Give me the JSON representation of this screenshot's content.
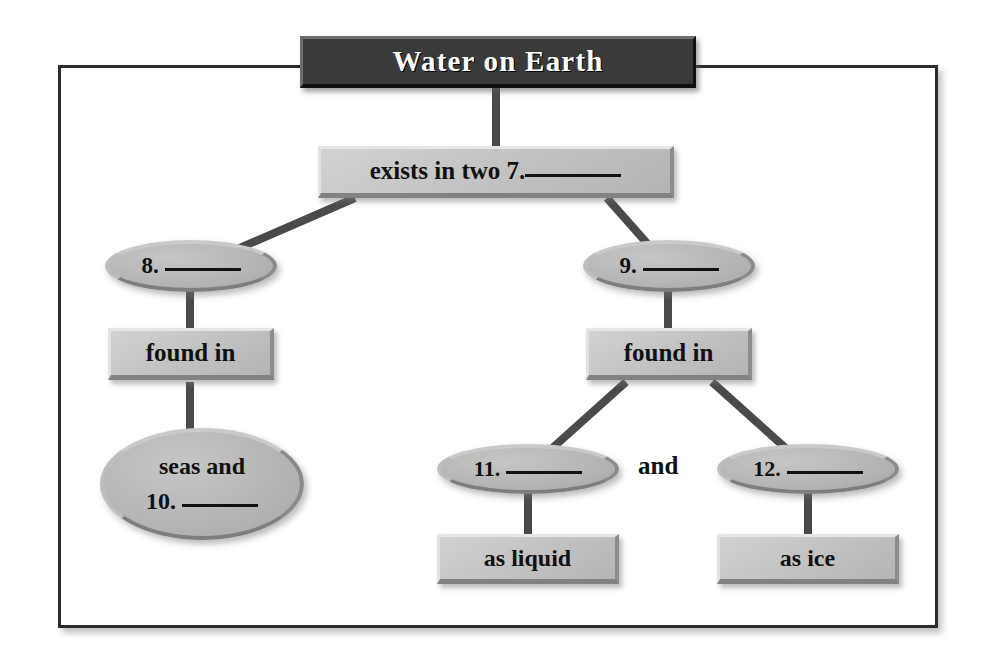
{
  "diagram": {
    "title": "Water on Earth",
    "conjunction": "and",
    "nodes": {
      "root": {
        "label": "Water on Earth",
        "shape": "banner"
      },
      "exists": {
        "label": "exists in two 7.",
        "blank": true,
        "shape": "rectangle"
      },
      "item8": {
        "label": "8.",
        "blank": true,
        "shape": "oval"
      },
      "item9": {
        "label": "9.",
        "blank": true,
        "shape": "oval"
      },
      "found_in_left": {
        "label": "found in",
        "blank": false,
        "shape": "rectangle"
      },
      "found_in_right": {
        "label": "found in",
        "blank": false,
        "shape": "rectangle"
      },
      "seas": {
        "line1": "seas and",
        "line2": "10.",
        "blank": true,
        "shape": "oval"
      },
      "item11": {
        "label": "11.",
        "blank": true,
        "shape": "oval"
      },
      "item12": {
        "label": "12.",
        "blank": true,
        "shape": "oval"
      },
      "as_liquid": {
        "label": "as liquid",
        "blank": false,
        "shape": "rectangle"
      },
      "as_ice": {
        "label": "as ice",
        "blank": false,
        "shape": "rectangle"
      }
    },
    "colors": {
      "banner_fill": "#3a3a3a",
      "banner_text": "#ffffff",
      "node_fill": "#c4c4c4",
      "oval_fill": "#b9b9b9",
      "connector": "#4a4a4a",
      "frame": "#2b2b2b",
      "text": "#111111"
    }
  }
}
